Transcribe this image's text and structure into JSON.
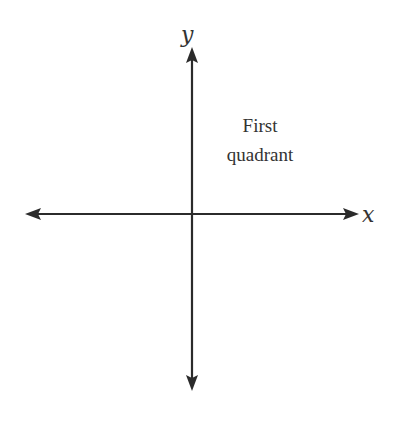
{
  "diagram": {
    "type": "cartesian-axes",
    "x_axis": {
      "label": "x",
      "y_position": 214,
      "x_start": 25,
      "x_end": 358,
      "arrows": [
        "left",
        "right"
      ]
    },
    "y_axis": {
      "label": "y",
      "x_position": 192,
      "y_start": 48,
      "y_end": 390,
      "arrows": [
        "up",
        "down"
      ]
    },
    "annotations": [
      {
        "name": "first-quadrant-label",
        "lines": [
          "First",
          "quadrant"
        ]
      }
    ],
    "colors": {
      "axis": "#2b2b2b",
      "text": "#333333",
      "background": "#ffffff"
    }
  }
}
